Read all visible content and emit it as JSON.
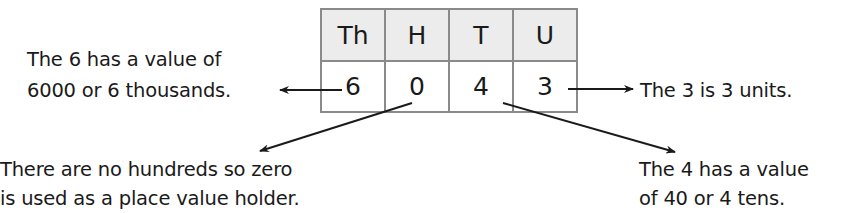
{
  "table": {
    "headers": [
      "Th",
      "H",
      "T",
      "U"
    ],
    "values": [
      "6",
      "0",
      "4",
      "3"
    ]
  },
  "notes": {
    "thousands": [
      "The 6 has a value of",
      "6000 or 6 thousands."
    ],
    "units": [
      "The 3 is 3 units."
    ],
    "hundreds": [
      "There are no hundreds so zero",
      "is used as a place value holder."
    ],
    "tens": [
      "The 4 has a value",
      "of 40 or 4 tens."
    ]
  },
  "colors": {
    "header_fill": "#ececec",
    "border": "#8a8a8a",
    "text": "#1a1a1a"
  }
}
